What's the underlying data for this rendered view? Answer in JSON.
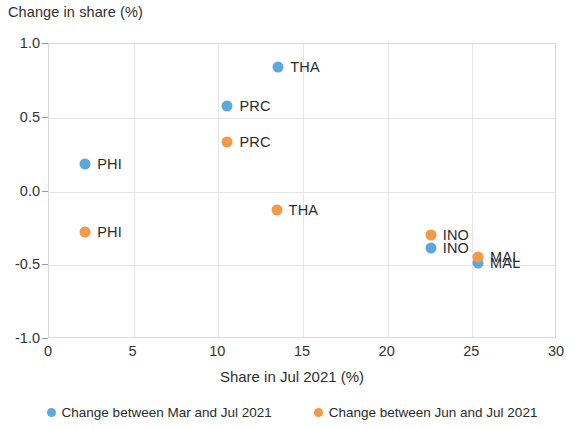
{
  "chart_data": {
    "type": "scatter",
    "title": "",
    "ylabel": "Change in share (%)",
    "xlabel": "Share in Jul 2021 (%)",
    "xlim": [
      0,
      30
    ],
    "ylim": [
      -1.0,
      1.0
    ],
    "xticks": [
      "0",
      "5",
      "10",
      "15",
      "20",
      "25",
      "30"
    ],
    "xtick_values": [
      0,
      5,
      10,
      15,
      20,
      25,
      30
    ],
    "yticks": [
      "1.0",
      "0.5",
      "0.0",
      "-0.5",
      "-1.0"
    ],
    "ytick_values": [
      1.0,
      0.5,
      0.0,
      -0.5,
      -1.0
    ],
    "grid": true,
    "legend_position": "bottom",
    "colors": {
      "mar_jul": "#5ba8dd",
      "jun_jul": "#f2994a",
      "grid": "#e6e6e6",
      "axis": "#d8d8d8",
      "text": "#2b2b2b"
    },
    "series": [
      {
        "name": "Change between Mar and Jul 2021",
        "color": "#5ba8dd",
        "points": [
          {
            "label": "THA",
            "x": 13.6,
            "y": 0.84,
            "label_side": "right"
          },
          {
            "label": "PRC",
            "x": 10.6,
            "y": 0.57,
            "label_side": "right"
          },
          {
            "label": "PHI",
            "x": 2.2,
            "y": 0.18,
            "label_side": "right"
          },
          {
            "label": "INO",
            "x": 22.6,
            "y": -0.39,
            "label_side": "right"
          },
          {
            "label": "MAL",
            "x": 25.4,
            "y": -0.49,
            "label_side": "right"
          }
        ]
      },
      {
        "name": "Change between Jun and Jul 2021",
        "color": "#f2994a",
        "points": [
          {
            "label": "PRC",
            "x": 10.6,
            "y": 0.33,
            "label_side": "right"
          },
          {
            "label": "THA",
            "x": 13.5,
            "y": -0.13,
            "label_side": "right"
          },
          {
            "label": "PHI",
            "x": 2.2,
            "y": -0.28,
            "label_side": "right"
          },
          {
            "label": "INO",
            "x": 22.6,
            "y": -0.3,
            "label_side": "right"
          },
          {
            "label": "MAL",
            "x": 25.4,
            "y": -0.45,
            "label_side": "right"
          }
        ]
      }
    ],
    "legend": [
      {
        "label": "Change between Mar and Jul 2021",
        "color": "#5ba8dd"
      },
      {
        "label": "Change between Jun and Jul 2021",
        "color": "#f2994a"
      }
    ]
  }
}
